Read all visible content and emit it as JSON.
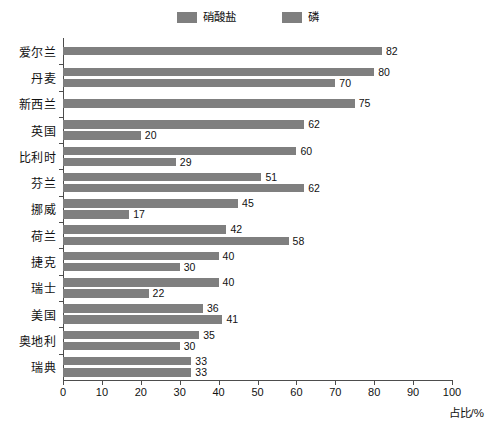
{
  "chart_data": {
    "type": "bar",
    "orientation": "horizontal",
    "title": "",
    "xlabel": "占比/%",
    "ylabel": "",
    "xlim": [
      0,
      100
    ],
    "xticks": [
      0,
      10,
      20,
      30,
      40,
      50,
      60,
      70,
      80,
      90,
      100
    ],
    "grid": false,
    "legend_position": "top-center",
    "categories": [
      "爱尔兰",
      "丹麦",
      "新西兰",
      "英国",
      "比利时",
      "芬兰",
      "挪威",
      "荷兰",
      "捷克",
      "瑞士",
      "美国",
      "奥地利",
      "瑞典"
    ],
    "series": [
      {
        "name": "硝酸盐",
        "color": "#7f7f7f",
        "values": [
          82,
          80,
          75,
          62,
          60,
          51,
          45,
          42,
          40,
          40,
          36,
          35,
          33
        ]
      },
      {
        "name": "磷",
        "color": "#7f7f7f",
        "values": [
          null,
          70,
          null,
          20,
          29,
          62,
          17,
          58,
          30,
          22,
          41,
          30,
          33
        ]
      }
    ],
    "rows": [
      {
        "category": "爱尔兰",
        "bars": [
          {
            "series": "硝酸盐",
            "value": 82,
            "label": "82"
          }
        ]
      },
      {
        "category": "丹麦",
        "bars": [
          {
            "series": "硝酸盐",
            "value": 80,
            "label": "80"
          },
          {
            "series": "磷",
            "value": 70,
            "label": "70"
          }
        ]
      },
      {
        "category": "新西兰",
        "bars": [
          {
            "series": "硝酸盐",
            "value": 75,
            "label": "75"
          }
        ]
      },
      {
        "category": "英国",
        "bars": [
          {
            "series": "硝酸盐",
            "value": 62,
            "label": "62"
          },
          {
            "series": "磷",
            "value": 20,
            "label": "20"
          }
        ]
      },
      {
        "category": "比利时",
        "bars": [
          {
            "series": "硝酸盐",
            "value": 60,
            "label": "60"
          },
          {
            "series": "磷",
            "value": 29,
            "label": "29"
          }
        ]
      },
      {
        "category": "芬兰",
        "bars": [
          {
            "series": "硝酸盐",
            "value": 51,
            "label": "51"
          },
          {
            "series": "磷",
            "value": 62,
            "label": "62"
          }
        ]
      },
      {
        "category": "挪威",
        "bars": [
          {
            "series": "硝酸盐",
            "value": 45,
            "label": "45"
          },
          {
            "series": "磷",
            "value": 17,
            "label": "17"
          }
        ]
      },
      {
        "category": "荷兰",
        "bars": [
          {
            "series": "硝酸盐",
            "value": 42,
            "label": "42"
          },
          {
            "series": "磷",
            "value": 58,
            "label": "58"
          }
        ]
      },
      {
        "category": "捷克",
        "bars": [
          {
            "series": "硝酸盐",
            "value": 40,
            "label": "40"
          },
          {
            "series": "磷",
            "value": 30,
            "label": "30"
          }
        ]
      },
      {
        "category": "瑞士",
        "bars": [
          {
            "series": "硝酸盐",
            "value": 40,
            "label": "40"
          },
          {
            "series": "磷",
            "value": 22,
            "label": "22"
          }
        ]
      },
      {
        "category": "美国",
        "bars": [
          {
            "series": "硝酸盐",
            "value": 36,
            "label": "36"
          },
          {
            "series": "磷",
            "value": 41,
            "label": "41"
          }
        ]
      },
      {
        "category": "奥地利",
        "bars": [
          {
            "series": "硝酸盐",
            "value": 35,
            "label": "35"
          },
          {
            "series": "磷",
            "value": 30,
            "label": "30"
          }
        ]
      },
      {
        "category": "瑞典",
        "bars": [
          {
            "series": "硝酸盐",
            "value": 33,
            "label": "33"
          },
          {
            "series": "磷",
            "value": 33,
            "label": "33"
          }
        ]
      }
    ]
  },
  "legend": {
    "items": [
      {
        "label": "硝酸盐",
        "color": "#7f7f7f"
      },
      {
        "label": "磷",
        "color": "#7f7f7f"
      }
    ]
  },
  "axis": {
    "x_title": "占比/%",
    "tick_labels": [
      "0",
      "10",
      "20",
      "30",
      "40",
      "50",
      "60",
      "70",
      "80",
      "90",
      "100"
    ]
  },
  "colors": {
    "bar": "#7f7f7f",
    "axis": "#4d4d4d",
    "text": "#111111",
    "background": "#ffffff"
  }
}
